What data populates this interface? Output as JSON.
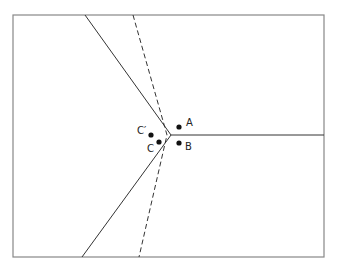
{
  "diagram": {
    "frame": {
      "x": 13,
      "y": 15,
      "width": 311,
      "height": 242,
      "stroke": "#888888"
    },
    "vertex": {
      "x": 171,
      "y": 135
    },
    "solid_lines": [
      {
        "name": "upper-left-boundary",
        "x1": 85,
        "y1": 15,
        "x2": 171,
        "y2": 135
      },
      {
        "name": "right-boundary",
        "x1": 171,
        "y1": 135,
        "x2": 324,
        "y2": 135
      },
      {
        "name": "lower-left-boundary",
        "x1": 171,
        "y1": 135,
        "x2": 82,
        "y2": 257
      }
    ],
    "dashed_line": {
      "name": "dashed-boundary",
      "points": [
        [
          133,
          15
        ],
        [
          167,
          135
        ],
        [
          139,
          257
        ]
      ]
    },
    "line_color": "#333333",
    "points": [
      {
        "id": "A",
        "label": "A",
        "x": 179,
        "y": 127,
        "label_x": 186,
        "label_y": 126
      },
      {
        "id": "B",
        "label": "B",
        "x": 179,
        "y": 143,
        "label_x": 185,
        "label_y": 150
      },
      {
        "id": "C",
        "label": "C",
        "x": 159,
        "y": 142,
        "label_x": 147,
        "label_y": 152
      },
      {
        "id": "Cprime",
        "label": "C′",
        "x": 151,
        "y": 135,
        "label_x": 137,
        "label_y": 134
      }
    ],
    "point_color": "#111111"
  }
}
